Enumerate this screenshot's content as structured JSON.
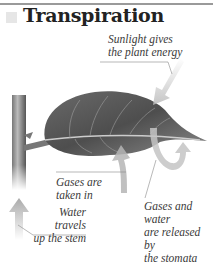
{
  "title": "Transpiration",
  "labels": {
    "sunlight": [
      "Sunlight gives",
      "the plant energy"
    ],
    "gases_in": [
      "Gases are",
      "taken in"
    ],
    "water": [
      "Water travels",
      "up the stem"
    ],
    "gases_out": [
      "Gases and water",
      "are released by",
      "the stomata"
    ]
  },
  "icons": [
    "sunlight-arrow-icon",
    "gases-in-arrow-icon",
    "water-up-arrow-icon",
    "gases-out-curved-arrow-icon",
    "leaf-illustration",
    "stem-illustration"
  ],
  "colors": {
    "ink": "#3a3a3a",
    "leaf_dark": "#5a5a5a",
    "arrow": "#c8c8c8",
    "rule": "#9a9a9a"
  }
}
